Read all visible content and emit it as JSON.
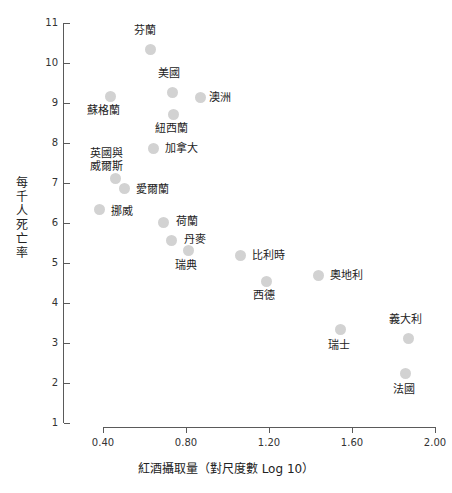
{
  "chart_data": {
    "type": "scatter",
    "title": "",
    "xlabel": "紅酒攝取量（對尺度數 Log 10）",
    "ylabel": "每千人死亡率",
    "ylabel_chars": [
      "每",
      "千",
      "人",
      "死",
      "亡",
      "率"
    ],
    "xlim": [
      0.2,
      2.0
    ],
    "ylim": [
      1,
      11
    ],
    "xticks": [
      "0.40",
      "0.80",
      "1.20",
      "1.60",
      "2.00"
    ],
    "xtick_values": [
      0.4,
      0.8,
      1.2,
      1.6,
      2.0
    ],
    "yticks": [
      "11",
      "10",
      "9",
      "8",
      "7",
      "6",
      "5",
      "4",
      "3",
      "2",
      "1"
    ],
    "ytick_values": [
      11,
      10,
      9,
      8,
      7,
      6,
      5,
      4,
      3,
      2,
      1
    ],
    "grid": false,
    "legend": null,
    "marker_color": "#d2d2d2",
    "axis_color": "#5a5a5a",
    "text_color": "#222222",
    "points": [
      {
        "label": "芬蘭",
        "x": 0.63,
        "y": 10.35,
        "px": 150,
        "py": 49,
        "lx": 134,
        "ly": 24
      },
      {
        "label": "美國",
        "x": 0.73,
        "y": 9.28,
        "px": 172,
        "py": 92,
        "lx": 158,
        "ly": 67
      },
      {
        "label": "澳洲",
        "x": 0.87,
        "y": 9.15,
        "px": 200,
        "py": 97,
        "lx": 209,
        "ly": 91
      },
      {
        "label": "蘇格蘭",
        "x": 0.43,
        "y": 9.08,
        "px": 110,
        "py": 96,
        "lx": 87,
        "ly": 104
      },
      {
        "label": "紐西蘭",
        "x": 0.74,
        "y": 8.73,
        "px": 173,
        "py": 114,
        "lx": 155,
        "ly": 122
      },
      {
        "label": "加拿大",
        "x": 0.64,
        "y": 7.88,
        "px": 153,
        "py": 148,
        "lx": 165,
        "ly": 142
      },
      {
        "label": "英國與\n威爾斯",
        "x": 0.46,
        "y": 7.13,
        "px": 115,
        "py": 178,
        "lx": 90,
        "ly": 147
      },
      {
        "label": "愛爾蘭",
        "x": 0.5,
        "y": 6.7,
        "px": 124,
        "py": 188,
        "lx": 136,
        "ly": 183
      },
      {
        "label": "挪威",
        "x": 0.38,
        "y": 6.18,
        "px": 99,
        "py": 209,
        "lx": 111,
        "ly": 205
      },
      {
        "label": "荷蘭",
        "x": 0.69,
        "y": 6.0,
        "px": 163,
        "py": 222,
        "lx": 176,
        "ly": 215
      },
      {
        "label": "丹麥",
        "x": 0.73,
        "y": 5.58,
        "px": 171,
        "py": 240,
        "lx": 184,
        "ly": 233
      },
      {
        "label": "瑞典",
        "x": 0.81,
        "y": 5.33,
        "px": 188,
        "py": 250,
        "lx": 175,
        "ly": 259
      },
      {
        "label": "比利時",
        "x": 1.06,
        "y": 5.15,
        "px": 240,
        "py": 255,
        "lx": 252,
        "ly": 249
      },
      {
        "label": "西德",
        "x": 1.19,
        "y": 4.53,
        "px": 266,
        "py": 281,
        "lx": 253,
        "ly": 289
      },
      {
        "label": "奧地利",
        "x": 1.44,
        "y": 4.63,
        "px": 318,
        "py": 275,
        "lx": 330,
        "ly": 269
      },
      {
        "label": "瑞士",
        "x": 1.54,
        "y": 3.18,
        "px": 340,
        "py": 329,
        "lx": 328,
        "ly": 339
      },
      {
        "label": "義大利",
        "x": 1.87,
        "y": 3.08,
        "px": 408,
        "py": 338,
        "lx": 389,
        "ly": 313
      },
      {
        "label": "法國",
        "x": 1.86,
        "y": 2.15,
        "px": 405,
        "py": 373,
        "lx": 393,
        "ly": 383
      }
    ]
  }
}
